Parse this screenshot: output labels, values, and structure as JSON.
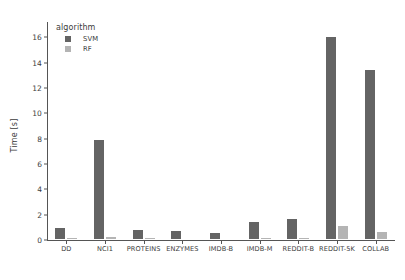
{
  "chart_data": {
    "type": "bar",
    "title": "",
    "xlabel": "",
    "ylabel": "Time [s]",
    "ylim": [
      0,
      17.2
    ],
    "yticks": [
      0,
      2,
      4,
      6,
      8,
      10,
      12,
      14,
      16
    ],
    "grid": false,
    "legend": {
      "title": "algorithm",
      "position": "upper left",
      "entries": [
        {
          "name": "SVM",
          "color": "#646464"
        },
        {
          "name": "RF",
          "color": "#b4b4b4"
        }
      ]
    },
    "categories": [
      "DD",
      "NCI1",
      "PROTEINS",
      "ENZYMES",
      "IMDB-B",
      "IMDB-M",
      "REDDIT-B",
      "REDDIT-5K",
      "COLLAB"
    ],
    "series": [
      {
        "name": "SVM",
        "color": "#646464",
        "values": [
          1.0,
          8.0,
          0.85,
          0.8,
          0.65,
          1.5,
          1.75,
          16.1,
          13.5
        ]
      },
      {
        "name": "RF",
        "color": "#b4b4b4",
        "values": [
          0.2,
          0.35,
          0.2,
          0.18,
          0.15,
          0.2,
          0.25,
          1.2,
          0.75
        ]
      }
    ]
  }
}
